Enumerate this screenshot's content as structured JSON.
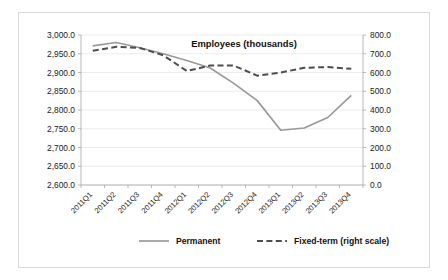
{
  "chart_data": {
    "type": "line",
    "title": "Employees (thousands)",
    "xlabel": "",
    "ylabel": "",
    "grid": true,
    "legend_position": "bottom",
    "categories": [
      "2011Q1",
      "2011Q2",
      "2011Q3",
      "2011Q4",
      "2012Q1",
      "2012Q2",
      "2012Q3",
      "2012Q4",
      "2013Q1",
      "2013Q2",
      "2013Q3",
      "2013Q4"
    ],
    "left_axis": {
      "name": "Permanent",
      "ylim": [
        2600.0,
        3000.0
      ],
      "tick_step": 50.0,
      "ticks": [
        "2,600.0",
        "2,650.0",
        "2,700.0",
        "2,750.0",
        "2,800.0",
        "2,850.0",
        "2,900.0",
        "2,950.0",
        "3,000.0"
      ]
    },
    "right_axis": {
      "name": "Fixed-term (right scale)",
      "ylim": [
        0.0,
        800.0
      ],
      "tick_step": 100.0,
      "ticks": [
        "0.0",
        "100.0",
        "200.0",
        "300.0",
        "400.0",
        "500.0",
        "600.0",
        "700.0",
        "800.0"
      ]
    },
    "series": [
      {
        "name": "Permanent",
        "axis": "left",
        "style": "solid",
        "color": "#9a9a9a",
        "values": [
          2971,
          2980,
          2966,
          2950,
          2932,
          2912,
          2871,
          2825,
          2746,
          2752,
          2780,
          2839
        ]
      },
      {
        "name": "Fixed-term (right scale)",
        "axis": "right",
        "style": "dashed",
        "color": "#4d4d4d",
        "values": [
          716,
          737,
          731,
          692,
          608,
          637,
          637,
          583,
          600,
          625,
          629,
          620
        ]
      }
    ]
  },
  "legend": {
    "items": [
      {
        "label": "Permanent",
        "style": "solid",
        "color": "#9a9a9a"
      },
      {
        "label": "Fixed-term (right scale)",
        "style": "dashed",
        "color": "#4d4d4d"
      }
    ]
  },
  "colors": {
    "permanent": "#9a9a9a",
    "fixed_term": "#4d4d4d",
    "grid": "#e4e4e4",
    "axis": "#a6a6a6",
    "border": "#d9d9d9",
    "text": "#1a1a1a"
  }
}
